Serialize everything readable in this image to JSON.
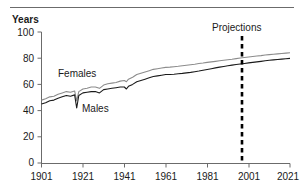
{
  "figure": {
    "axis_title": "Years",
    "line_color_males": "#1a1a1a",
    "line_color_females": "#8c8c8c",
    "rule_color": "#6b6b6b",
    "axis_color": "#6b6b6b"
  },
  "annotations": {
    "projections": "Projections",
    "females": "Females",
    "males": "Males"
  },
  "chart_data": {
    "type": "line",
    "title": "",
    "subtitle": "",
    "xlabel": "",
    "ylabel": "Years",
    "xlim": [
      1901,
      2021
    ],
    "ylim": [
      0,
      100
    ],
    "grid": false,
    "legend": "inline-labels",
    "xticks": [
      1901,
      1921,
      1941,
      1961,
      1981,
      2001,
      2021
    ],
    "yticks": [
      0,
      20,
      40,
      60,
      80,
      100
    ],
    "annotations": [
      {
        "text": "Projections",
        "x": 2001,
        "note": "dashed vertical divider at 2002 separating observed data from projected data"
      },
      {
        "text": "Females",
        "x": 1920,
        "y": 65,
        "note": "inline label for upper grey series"
      },
      {
        "text": "Males",
        "x": 1932,
        "y": 48,
        "note": "inline label for lower black series"
      }
    ],
    "series": [
      {
        "name": "Females",
        "color": "#8c8c8c",
        "x": [
          1901,
          1903,
          1905,
          1907,
          1909,
          1911,
          1913,
          1915,
          1917,
          1918,
          1919,
          1921,
          1923,
          1925,
          1927,
          1929,
          1931,
          1933,
          1935,
          1937,
          1939,
          1941,
          1942,
          1943,
          1945,
          1947,
          1949,
          1951,
          1953,
          1955,
          1957,
          1959,
          1961,
          1963,
          1965,
          1967,
          1969,
          1971,
          1973,
          1975,
          1977,
          1979,
          1981,
          1983,
          1985,
          1987,
          1989,
          1991,
          1993,
          1995,
          1997,
          1999,
          2001,
          2003,
          2005,
          2007,
          2009,
          2011,
          2013,
          2015,
          2017,
          2019,
          2021
        ],
        "y": [
          48.0,
          49.0,
          50.5,
          51.0,
          52.5,
          53.5,
          54.5,
          54.0,
          55.0,
          47.5,
          54.5,
          56.5,
          57.0,
          58.0,
          58.0,
          57.0,
          59.5,
          60.5,
          61.0,
          61.5,
          62.5,
          63.0,
          62.0,
          64.0,
          65.5,
          67.5,
          68.5,
          69.5,
          70.5,
          71.5,
          72.0,
          72.5,
          73.0,
          73.2,
          73.5,
          73.8,
          74.2,
          74.6,
          75.0,
          75.4,
          75.9,
          76.3,
          76.8,
          77.2,
          77.6,
          78.0,
          78.4,
          78.8,
          79.2,
          79.7,
          80.1,
          80.5,
          80.9,
          81.3,
          81.7,
          82.0,
          82.4,
          82.7,
          83.0,
          83.3,
          83.6,
          83.9,
          84.2
        ]
      },
      {
        "name": "Males",
        "color": "#1a1a1a",
        "x": [
          1901,
          1903,
          1905,
          1907,
          1909,
          1911,
          1913,
          1915,
          1917,
          1918,
          1919,
          1921,
          1923,
          1925,
          1927,
          1929,
          1931,
          1933,
          1935,
          1937,
          1939,
          1941,
          1942,
          1943,
          1945,
          1947,
          1949,
          1951,
          1953,
          1955,
          1957,
          1959,
          1961,
          1963,
          1965,
          1967,
          1969,
          1971,
          1973,
          1975,
          1977,
          1979,
          1981,
          1983,
          1985,
          1987,
          1989,
          1991,
          1993,
          1995,
          1997,
          1999,
          2001,
          2003,
          2005,
          2007,
          2009,
          2011,
          2013,
          2015,
          2017,
          2019,
          2021
        ],
        "y": [
          45.0,
          46.0,
          47.5,
          48.0,
          49.5,
          50.5,
          51.5,
          51.0,
          52.0,
          42.0,
          51.5,
          53.5,
          54.0,
          54.5,
          54.5,
          53.5,
          56.0,
          56.5,
          57.0,
          57.5,
          58.0,
          58.0,
          56.5,
          58.5,
          60.0,
          62.0,
          63.0,
          64.0,
          65.0,
          66.0,
          66.5,
          67.0,
          67.5,
          67.6,
          67.8,
          68.1,
          68.4,
          68.8,
          69.2,
          69.7,
          70.2,
          70.8,
          71.4,
          72.0,
          72.6,
          73.2,
          73.7,
          74.2,
          74.7,
          75.2,
          75.6,
          76.0,
          76.4,
          76.8,
          77.2,
          77.6,
          78.0,
          78.4,
          78.7,
          79.0,
          79.3,
          79.6,
          79.9
        ]
      }
    ]
  }
}
